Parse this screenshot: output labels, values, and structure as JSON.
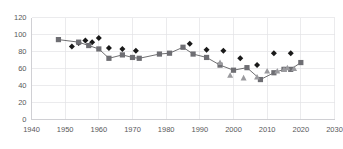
{
  "chart": {
    "title": "",
    "width": 343,
    "height": 149,
    "background": "#ffffff",
    "grid": true,
    "legend": "none"
  },
  "chart_data": {
    "type": "scatter",
    "title": "",
    "subtitle": "",
    "xlabel": "",
    "ylabel": "",
    "xlim": [
      1940,
      2030
    ],
    "ylim": [
      0,
      120
    ],
    "xticks": [
      1940,
      1950,
      1960,
      1970,
      1980,
      1990,
      2000,
      2010,
      2020,
      2030
    ],
    "yticks": [
      0,
      20,
      40,
      60,
      80,
      100,
      120
    ],
    "xtick_labels": [
      "1940",
      "1950",
      "1960",
      "1970",
      "1980",
      "1990",
      "2000",
      "2010",
      "2020",
      "2030"
    ],
    "ytick_labels": [
      "0",
      "20",
      "40",
      "60",
      "80",
      "100",
      "120"
    ],
    "grid": true,
    "legend_position": "none",
    "series": [
      {
        "name": "diamond-series",
        "marker": "diamond",
        "color": "#1a1a1a",
        "connector": false,
        "points": [
          {
            "x": 1952,
            "y": 86
          },
          {
            "x": 1954,
            "y": 90
          },
          {
            "x": 1956,
            "y": 93
          },
          {
            "x": 1958,
            "y": 91
          },
          {
            "x": 1960,
            "y": 96
          },
          {
            "x": 1963,
            "y": 84
          },
          {
            "x": 1967,
            "y": 83
          },
          {
            "x": 1971,
            "y": 81
          },
          {
            "x": 1987,
            "y": 89
          },
          {
            "x": 1992,
            "y": 82
          },
          {
            "x": 1997,
            "y": 81
          },
          {
            "x": 2002,
            "y": 72
          },
          {
            "x": 2007,
            "y": 64
          },
          {
            "x": 2012,
            "y": 78
          },
          {
            "x": 2017,
            "y": 78
          }
        ]
      },
      {
        "name": "square-series",
        "marker": "square",
        "color": "#6e6e73",
        "connector": true,
        "connector_color": "#4a4a4d",
        "points": [
          {
            "x": 1948,
            "y": 94
          },
          {
            "x": 1954,
            "y": 91
          },
          {
            "x": 1957,
            "y": 87
          },
          {
            "x": 1960,
            "y": 83
          },
          {
            "x": 1963,
            "y": 72
          },
          {
            "x": 1967,
            "y": 76
          },
          {
            "x": 1970,
            "y": 73
          },
          {
            "x": 1972,
            "y": 72
          },
          {
            "x": 1978,
            "y": 77
          },
          {
            "x": 1981,
            "y": 78
          },
          {
            "x": 1985,
            "y": 85
          },
          {
            "x": 1988,
            "y": 77
          },
          {
            "x": 1992,
            "y": 73
          },
          {
            "x": 1996,
            "y": 64
          },
          {
            "x": 2000,
            "y": 58
          },
          {
            "x": 2004,
            "y": 61
          },
          {
            "x": 2008,
            "y": 47
          },
          {
            "x": 2012,
            "y": 55
          },
          {
            "x": 2015,
            "y": 59
          },
          {
            "x": 2017,
            "y": 59
          },
          {
            "x": 2020,
            "y": 67
          }
        ]
      },
      {
        "name": "triangle-series",
        "marker": "triangle",
        "color": "#9a9a9e",
        "connector": false,
        "points": [
          {
            "x": 1996,
            "y": 67
          },
          {
            "x": 1999,
            "y": 52
          },
          {
            "x": 2003,
            "y": 49
          },
          {
            "x": 2007,
            "y": 50
          },
          {
            "x": 2010,
            "y": 57
          },
          {
            "x": 2013,
            "y": 57
          },
          {
            "x": 2015,
            "y": 59
          },
          {
            "x": 2016,
            "y": 61
          },
          {
            "x": 2018,
            "y": 60
          }
        ]
      }
    ]
  }
}
